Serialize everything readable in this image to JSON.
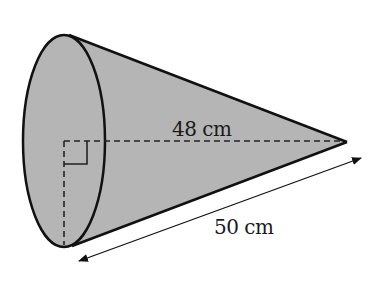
{
  "diagram": {
    "shape": "cone",
    "colors": {
      "fill": "#b5b5b5",
      "stroke": "#111111",
      "background": "#ffffff"
    },
    "labels": {
      "height": "48 cm",
      "slant_height": "50 cm"
    },
    "measurements": {
      "perpendicular_height_cm": 48,
      "slant_height_cm": 50
    },
    "annotations": {
      "right_angle_marker": true,
      "dashed_height_line": true,
      "dashed_radius_line": true,
      "double_headed_arrow": "slant_height"
    }
  }
}
